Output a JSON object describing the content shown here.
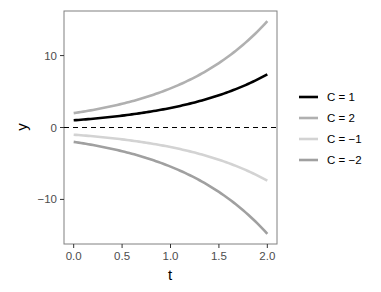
{
  "chart_data": {
    "type": "line",
    "title": "",
    "xlabel": "t",
    "ylabel": "y",
    "xlim": [
      -0.1,
      2.1
    ],
    "ylim": [
      -16.2,
      16.2
    ],
    "x_ticks": [
      0.0,
      0.5,
      1.0,
      1.5,
      2.0
    ],
    "x_tick_labels": [
      "0.0",
      "0.5",
      "1.0",
      "1.5",
      "2.0"
    ],
    "y_ticks": [
      -10,
      0,
      10
    ],
    "y_tick_labels": [
      "−10",
      "0",
      "10"
    ],
    "grid": false,
    "legend_position": "right",
    "reference_line": {
      "y": 0,
      "style": "dashed",
      "color": "#000000"
    },
    "x": [
      0.0,
      0.25,
      0.5,
      0.75,
      1.0,
      1.25,
      1.5,
      1.75,
      2.0
    ],
    "series": [
      {
        "name": "C = 1",
        "color": "#000000",
        "values": [
          1.0,
          1.28,
          1.65,
          2.12,
          2.72,
          3.49,
          4.48,
          5.75,
          7.39
        ]
      },
      {
        "name": "C = 2",
        "color": "#b0b0b0",
        "values": [
          2.0,
          2.57,
          3.3,
          4.23,
          5.44,
          6.98,
          8.96,
          11.51,
          14.78
        ]
      },
      {
        "name": "C = −1",
        "color": "#d3d3d3",
        "values": [
          -1.0,
          -1.28,
          -1.65,
          -2.12,
          -2.72,
          -3.49,
          -4.48,
          -5.75,
          -7.39
        ]
      },
      {
        "name": "C = −2",
        "color": "#a0a0a0",
        "values": [
          -2.0,
          -2.57,
          -3.3,
          -4.23,
          -5.44,
          -6.98,
          -8.96,
          -11.51,
          -14.78
        ]
      }
    ]
  }
}
